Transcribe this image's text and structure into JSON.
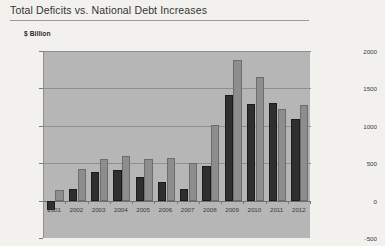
{
  "chart_data": {
    "type": "bar",
    "title": "Total Deficits vs. National Debt Increases",
    "unit_label": "$ Billion",
    "xlabel": "",
    "ylabel": "$ Billion",
    "ylim": [
      -500,
      2000
    ],
    "ytick_labels": [
      "2000",
      "1500",
      "1000",
      "500",
      "0",
      "-500"
    ],
    "ytick_values": [
      2000,
      1500,
      1000,
      500,
      0,
      -500
    ],
    "grid": true,
    "legend": "none",
    "categories": [
      "2001",
      "2002",
      "2003",
      "2004",
      "2005",
      "2006",
      "2007",
      "2008",
      "2009",
      "2010",
      "2011",
      "2012"
    ],
    "series": [
      {
        "name": "Total Deficit",
        "color": "#2f2f2f",
        "values": [
          -128,
          158,
          377,
          412,
          318,
          248,
          161,
          459,
          1413,
          1294,
          1300,
          1087
        ]
      },
      {
        "name": "National Debt Increase",
        "color": "#8d8d8d",
        "values": [
          140,
          420,
          554,
          596,
          553,
          574,
          501,
          1017,
          1885,
          1652,
          1229,
          1276
        ]
      }
    ]
  },
  "colors": {
    "page_background": "#f2f1ee",
    "plot_background": "#b6b6b6",
    "gridline": "#8f8f8f",
    "deficit_series": "#2f2f2f",
    "debt_series": "#8d8d8d"
  }
}
